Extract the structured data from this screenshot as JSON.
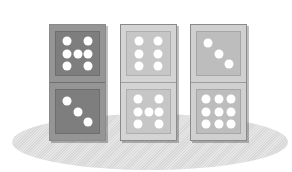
{
  "scene": {
    "background": "#ffffff",
    "shadow_color": "#dcdcdc"
  },
  "dominoes": [
    {
      "left": 49,
      "face": "#7e7e7e",
      "frame": "#959595",
      "top_pips": 6,
      "bottom_pips": 3
    },
    {
      "left": 120,
      "face": "#c6c6c6",
      "frame": "#d4d4d4",
      "top_pips": 6,
      "bottom_pips": 7
    },
    {
      "left": 190,
      "face": "#bdbdbd",
      "frame": "#d0d0d0",
      "top_pips": 3,
      "bottom_pips": 9
    }
  ]
}
